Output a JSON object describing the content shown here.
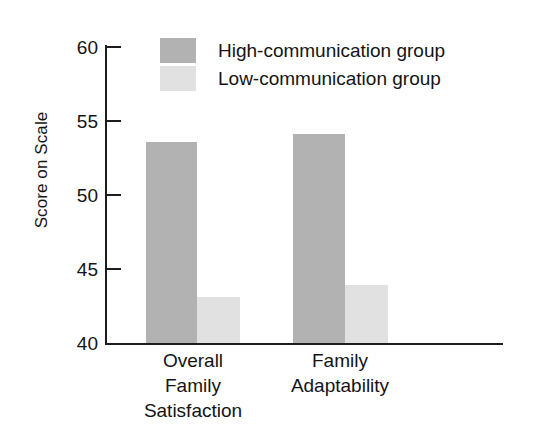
{
  "chart_data": {
    "type": "bar",
    "title": "",
    "subtitle": "",
    "xlabel": "",
    "ylabel": "Score on Scale",
    "ylim": [
      40,
      60
    ],
    "yticks": [
      40,
      45,
      50,
      55,
      60
    ],
    "ytick_labels": [
      "60",
      "55",
      "50",
      "45",
      "40"
    ],
    "grid": false,
    "legend_position": "top-center",
    "categories": [
      "Overall Family Satisfaction",
      "Family Adaptability"
    ],
    "category_lines": [
      [
        "Overall",
        "Family",
        "Satisfaction"
      ],
      [
        "Family",
        "Adaptability"
      ]
    ],
    "series": [
      {
        "name": "High-communication group",
        "color": "#b2b2b2",
        "values": [
          53.6,
          54.1
        ]
      },
      {
        "name": "Low-communication group",
        "color": "#e1e1e1",
        "values": [
          43.1,
          43.9
        ]
      }
    ]
  },
  "axis": {
    "y_title": "Score on Scale",
    "tick_60": "60",
    "tick_55": "55",
    "tick_50": "50",
    "tick_45": "45",
    "tick_40": "40"
  },
  "legend": {
    "items": [
      {
        "label": "High-communication group",
        "color": "#b2b2b2"
      },
      {
        "label": "Low-communication group",
        "color": "#e1e1e1"
      }
    ]
  },
  "categories": [
    {
      "line1": "Overall",
      "line2": "Family",
      "line3": "Satisfaction"
    },
    {
      "line1": "Family",
      "line2": "Adaptability",
      "line3": ""
    }
  ],
  "colors": {
    "high_group": "#b2b2b2",
    "low_group": "#e1e1e1",
    "axis": "#1d1d1d",
    "text": "#141414",
    "background": "#ffffff"
  }
}
